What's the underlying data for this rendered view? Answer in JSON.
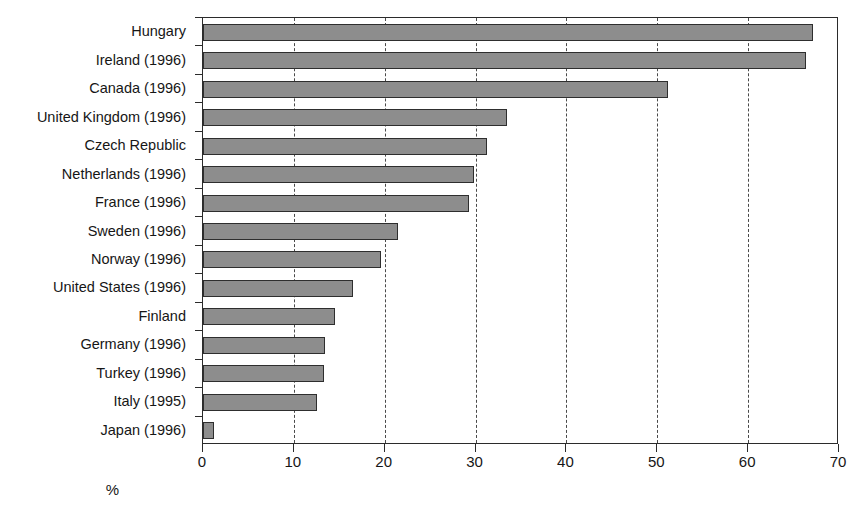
{
  "chart_data": {
    "type": "bar",
    "orientation": "horizontal",
    "title": "",
    "xlabel": "%",
    "ylabel": "",
    "xlim": [
      0,
      70
    ],
    "xticks": [
      0,
      10,
      20,
      30,
      40,
      50,
      60,
      70
    ],
    "xtick_labels": [
      "0",
      "10",
      "20",
      "30",
      "40",
      "50",
      "60",
      "70"
    ],
    "grid": "vertical dashed gridlines at each x tick",
    "legend": "none",
    "bar_color": "#8d8d8d",
    "bar_edge_color": "#2e2e2e",
    "categories": [
      "Hungary",
      "Ireland (1996)",
      "Canada (1996)",
      "United Kingdom (1996)",
      "Czech Republic",
      "Netherlands (1996)",
      "France (1996)",
      "Sweden (1996)",
      "Norway (1996)",
      "United States (1996)",
      "Finland",
      "Germany (1996)",
      "Turkey (1996)",
      "Italy (1995)",
      "Japan (1996)"
    ],
    "values": [
      67.1,
      66.4,
      51.2,
      33.5,
      31.3,
      29.8,
      29.3,
      21.5,
      19.6,
      16.5,
      14.5,
      13.4,
      13.3,
      12.5,
      1.2
    ]
  }
}
